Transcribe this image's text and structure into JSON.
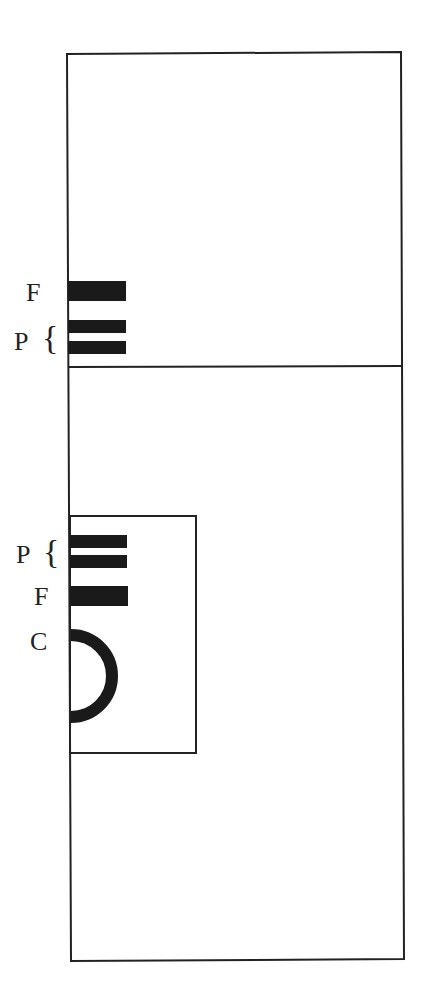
{
  "diagram": {
    "colors": {
      "line": "#222222",
      "fill": "#1a1a1a",
      "background": "#ffffff"
    },
    "upper_compartment": {
      "labels": {
        "f": "F",
        "p": "P",
        "p_brace": "{"
      }
    },
    "lower_compartment": {
      "inner_box": {
        "labels": {
          "p": "P",
          "p_brace": "{",
          "f": "F",
          "c": "C"
        }
      }
    }
  }
}
